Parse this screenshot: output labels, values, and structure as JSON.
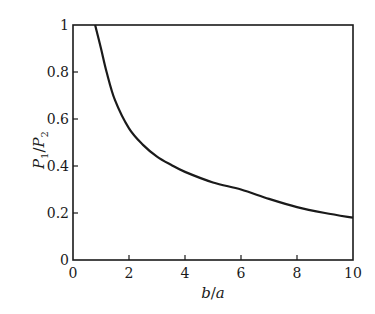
{
  "chart_data": {
    "type": "line",
    "title": "",
    "xlabel": "b/a",
    "ylabel": "P1/P2",
    "xlim": [
      0,
      10
    ],
    "ylim": [
      0,
      1
    ],
    "grid": false,
    "legend": null,
    "x_ticks": [
      0,
      2,
      4,
      6,
      8,
      10
    ],
    "x_tick_labels": [
      "0",
      "2",
      "4",
      "6",
      "8",
      "10"
    ],
    "y_ticks": [
      0,
      0.2,
      0.4,
      0.6,
      0.8,
      1
    ],
    "y_tick_labels": [
      "0",
      "0.2",
      "0.4",
      "0.6",
      "0.8",
      "1"
    ],
    "series": [
      {
        "name": "P1/P2 vs b/a",
        "color": "#1a1a1a",
        "x": [
          0.79,
          1.0,
          1.2,
          1.5,
          2.0,
          2.5,
          3.0,
          3.5,
          4.0,
          5.0,
          6.0,
          7.0,
          8.0,
          9.0,
          10.0
        ],
        "y": [
          1.0,
          0.9,
          0.8,
          0.68,
          0.56,
          0.49,
          0.44,
          0.405,
          0.375,
          0.33,
          0.3,
          0.26,
          0.225,
          0.2,
          0.18
        ]
      }
    ]
  },
  "labels": {
    "xlabel_b": "b",
    "xlabel_sep": "/",
    "xlabel_a": "a",
    "ylabel_p": "P",
    "ylabel_sub1": "1",
    "ylabel_sep": "/",
    "ylabel_sub2": "2"
  }
}
